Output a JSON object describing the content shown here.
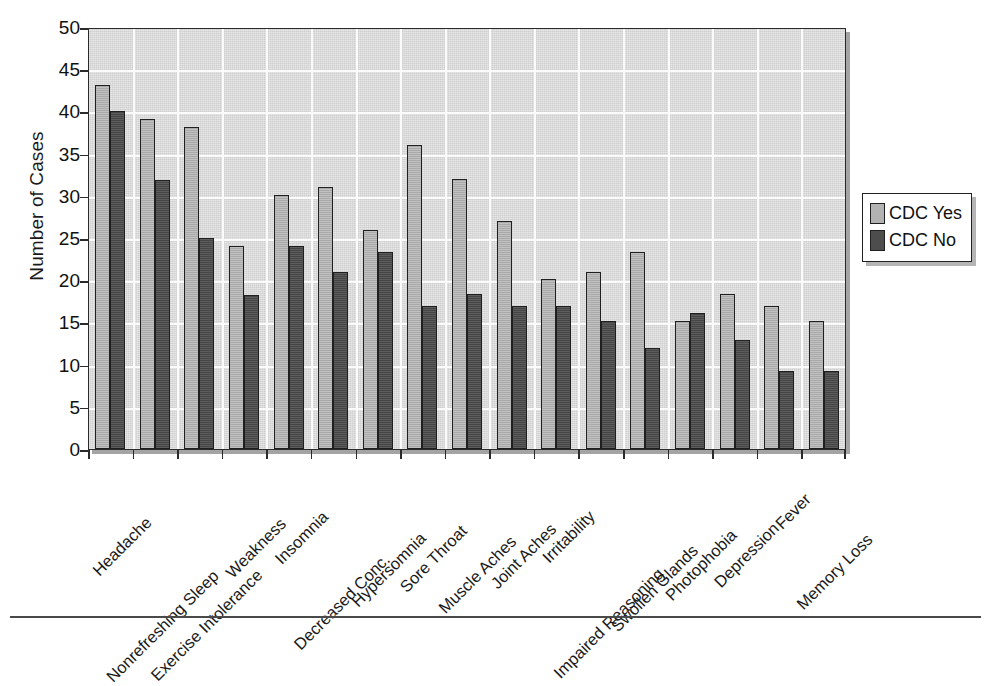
{
  "chart_data": {
    "type": "bar",
    "title": "",
    "xlabel": "",
    "ylabel": "Number of Cases",
    "ylim": [
      0,
      50
    ],
    "ytick_step": 5,
    "yticks": [
      50,
      45,
      40,
      35,
      30,
      25,
      20,
      15,
      10,
      5,
      0
    ],
    "grid": true,
    "legend_position": "right",
    "categories": [
      "Headache",
      "Nonrefreshing Sleep",
      "Exercise Intolerance",
      "Weakness",
      "Insomnia",
      "Decreased Conc.",
      "Hypersomnia",
      "Sore Throat",
      "Muscle Aches",
      "Joint Aches",
      "Irritability",
      "Impaired Reasoning",
      "Swollen Glands",
      "Photophobia",
      "Depression",
      "Fever",
      "Memory Loss"
    ],
    "series": [
      {
        "name": "CDC Yes",
        "color": "#b2b2b2",
        "values": [
          43.1,
          39.1,
          38.1,
          24.1,
          30.1,
          31.0,
          26.0,
          36.0,
          32.0,
          27.0,
          20.2,
          21.0,
          23.4,
          15.2,
          18.4,
          17.0,
          15.2
        ]
      },
      {
        "name": "CDC No",
        "color": "#4d4d4d",
        "values": [
          40.0,
          31.9,
          25.0,
          18.3,
          24.1,
          21.0,
          23.4,
          17.0,
          18.4,
          17.0,
          17.0,
          15.2,
          12.0,
          16.1,
          12.9,
          9.3,
          9.3
        ]
      }
    ]
  },
  "legend": {
    "items": [
      {
        "label": "CDC Yes",
        "swatch": "series-yes"
      },
      {
        "label": "CDC No",
        "swatch": "series-no"
      }
    ]
  },
  "colors": {
    "series_yes": "#b2b2b2",
    "series_no": "#4d4d4d",
    "plot_background": "#d9d9d9",
    "gridline": "#fbfbfb",
    "axis": "#2b2b2b",
    "text": "#111111"
  }
}
